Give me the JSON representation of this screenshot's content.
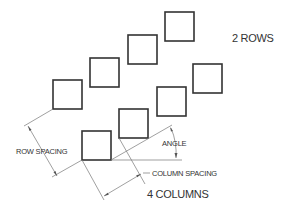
{
  "diagram": {
    "labels": {
      "rows": "2 ROWS",
      "columns": "4 COLUMNS",
      "row_spacing": "ROW SPACING",
      "column_spacing": "COLUMN SPACING",
      "angle": "ANGLE"
    },
    "rows": 2,
    "columns": 4,
    "colors": {
      "square_stroke": "#333333",
      "dimension_line": "#666666",
      "text": "#333333"
    }
  }
}
